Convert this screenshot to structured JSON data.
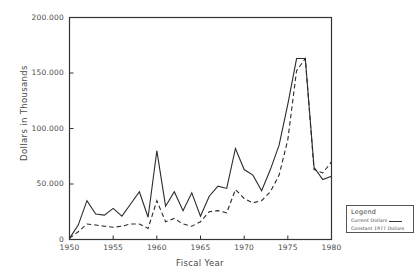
{
  "chart_data": {
    "type": "line",
    "title": "",
    "xlabel": "Fiscal Year",
    "ylabel": "Dollars in Thousands",
    "xlim": [
      1950,
      1980
    ],
    "ylim": [
      0,
      200000
    ],
    "grid": false,
    "legend_position": "outside-bottom-right",
    "legend_title": "Legend",
    "x_tick_labels": [
      "1950",
      "1955",
      "1960",
      "1965",
      "1970",
      "1975",
      "1980"
    ],
    "x_ticks": [
      1950,
      1955,
      1960,
      1965,
      1970,
      1975,
      1980
    ],
    "y_tick_labels": [
      "0",
      "50.000",
      "100.000",
      "150.000",
      "200.000"
    ],
    "y_ticks": [
      0,
      50000,
      100000,
      150000,
      200000
    ],
    "x": [
      1950,
      1951,
      1952,
      1953,
      1954,
      1955,
      1956,
      1957,
      1958,
      1959,
      1960,
      1961,
      1962,
      1963,
      1964,
      1965,
      1966,
      1967,
      1968,
      1969,
      1970,
      1971,
      1972,
      1973,
      1974,
      1975,
      1976,
      1977,
      1978,
      1979,
      1980
    ],
    "series": [
      {
        "name": "Current Dollars",
        "style": "solid",
        "values": [
          1000,
          13000,
          35000,
          23000,
          22000,
          28000,
          21000,
          32000,
          43000,
          20000,
          80000,
          30000,
          43000,
          26000,
          42000,
          21000,
          39000,
          48000,
          46000,
          82000,
          63000,
          58000,
          44000,
          63000,
          85000,
          122000,
          163000,
          163000,
          65000,
          54000,
          57000
        ]
      },
      {
        "name": "Constant 1977 Dollars",
        "style": "dashed",
        "values": [
          1000,
          7000,
          14000,
          13000,
          12000,
          11000,
          12000,
          14000,
          14000,
          10000,
          35000,
          16000,
          19000,
          14000,
          12000,
          16000,
          25000,
          26000,
          24000,
          45000,
          37000,
          33000,
          35000,
          43000,
          58000,
          90000,
          152000,
          163000,
          63000,
          60000,
          70000
        ]
      }
    ]
  },
  "legend": {
    "title": "Legend",
    "items": [
      {
        "label": "Current Dollars",
        "style": "solid"
      },
      {
        "label": "Constant 1977 Dollars",
        "style": "dashed"
      }
    ]
  },
  "axes": {
    "x_title": "Fiscal Year",
    "y_title": "Dollars in Thousands"
  },
  "colors": {
    "axis": "#333333",
    "line": "#2b2b2b",
    "background": "#ffffff",
    "text": "#4a4a4a"
  }
}
